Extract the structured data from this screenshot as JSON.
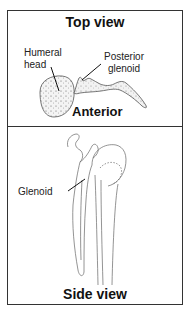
{
  "top_panel": {
    "title": "Top view",
    "labels": {
      "humeral_head_line1": "Humeral",
      "humeral_head_line2": "head",
      "posterior_glenoid_line1": "Posterior",
      "posterior_glenoid_line2": "glenoid",
      "anterior": "Anterior"
    }
  },
  "bottom_panel": {
    "title": "Side view",
    "labels": {
      "glenoid": "Glenoid"
    }
  },
  "colors": {
    "border": "#333333",
    "line": "#555555",
    "text": "#111111",
    "background": "#ffffff"
  }
}
